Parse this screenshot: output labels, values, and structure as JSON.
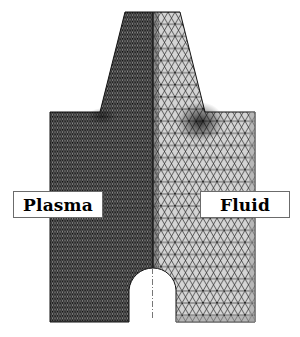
{
  "figure": {
    "type": "finite-element mesh",
    "regions": [
      {
        "id": "plasma",
        "label": "Plasma",
        "side": "left",
        "mesh": "fine",
        "fill": "#3a3a3a"
      },
      {
        "id": "fluid",
        "label": "Fluid",
        "side": "right",
        "mesh": "coarse",
        "fill": "#d2d2d2"
      }
    ],
    "colors": {
      "background": "#ffffff",
      "plasma_mesh": "#2e2e2e",
      "fluid_fill": "#d4d4d4",
      "fluid_edges": "#1e1e1e",
      "label_border": "#6b6b6b"
    }
  },
  "labels": {
    "plasma": "Plasma",
    "fluid": "Fluid"
  }
}
